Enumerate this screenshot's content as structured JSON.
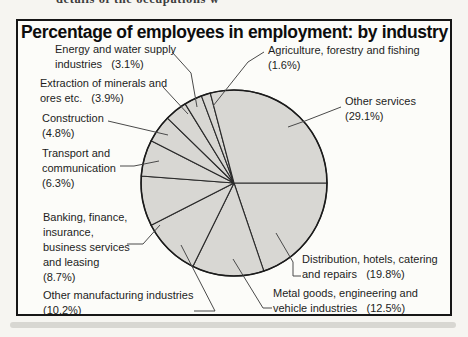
{
  "page": {
    "cropped_top_text": "details of the occupations w",
    "background_color": "#f6f5f1",
    "frame_border_color": "#161616"
  },
  "chart_data": {
    "type": "pie",
    "title": "Percentage of employees in employment: by industry",
    "unit": "%",
    "total": 100,
    "start_angle_deg": 0,
    "direction": "clockwise",
    "legend_position": "none (leader-line labels around pie)",
    "pie": {
      "cx": 234,
      "cy": 183,
      "r": 93,
      "fill": "#d8d7d3",
      "stroke": "#1b1b1b",
      "line_color": "#2a2a2a",
      "leader_color": "#4a4a4a"
    },
    "slices": [
      {
        "name": "Distribution, hotels, catering and repairs",
        "value": 19.8,
        "label_lines": [
          "Distribution, hotels, catering",
          "and repairs   (19.8%)"
        ],
        "label_x": 302,
        "label_y": 252,
        "leader": [
          [
            301,
            276
          ],
          [
            293,
            276
          ],
          [
            293,
            262
          ],
          [
            276,
            233
          ]
        ]
      },
      {
        "name": "Metal goods, engineering and vehicle industries",
        "value": 12.5,
        "label_lines": [
          "Metal goods, engineering and",
          "vehicle industries   (12.5%)"
        ],
        "label_x": 273,
        "label_y": 286,
        "leader": [
          [
            272,
            308
          ],
          [
            263,
            308
          ],
          [
            233,
            259
          ]
        ]
      },
      {
        "name": "Other manufacturing industries",
        "value": 10.2,
        "label_lines": [
          "Other manufacturing industries",
          "(10.2%)"
        ],
        "label_x": 43,
        "label_y": 288,
        "leader": [
          [
            194,
            311
          ],
          [
            215,
            311
          ],
          [
            181,
            245
          ]
        ]
      },
      {
        "name": "Banking, finance, insurance, business services and leasing",
        "value": 8.7,
        "label_lines": [
          "Banking, finance,",
          "insurance,",
          "business services",
          "and leasing",
          "(8.7%)"
        ],
        "label_x": 43,
        "label_y": 210,
        "leader": [
          [
            127,
            244
          ],
          [
            143,
            244
          ],
          [
            160,
            225
          ]
        ]
      },
      {
        "name": "Transport and communication",
        "value": 6.3,
        "label_lines": [
          "Transport and",
          "communication",
          "(6.3%)"
        ],
        "label_x": 42,
        "label_y": 146,
        "leader": [
          [
            120,
            166
          ],
          [
            134,
            166
          ],
          [
            159,
            161
          ]
        ]
      },
      {
        "name": "Construction",
        "value": 4.8,
        "label_lines": [
          "Construction",
          "(4.8%)"
        ],
        "label_x": 42,
        "label_y": 111,
        "leader": [
          [
            108,
            121
          ],
          [
            168,
            135
          ]
        ]
      },
      {
        "name": "Extraction of minerals and ores etc.",
        "value": 3.9,
        "label_lines": [
          "Extraction of minerals and",
          "ores etc.   (3.9%)"
        ],
        "label_x": 40,
        "label_y": 76,
        "leader": [
          [
            163,
            87
          ],
          [
            188,
            114
          ]
        ]
      },
      {
        "name": "Energy and water supply industries",
        "value": 3.1,
        "label_lines": [
          "Energy and water supply",
          "industries   (3.1%)"
        ],
        "label_x": 55,
        "label_y": 42,
        "leader": [
          [
            172,
            52
          ],
          [
            191,
            73
          ],
          [
            197,
            107
          ]
        ]
      },
      {
        "name": "Agriculture, forestry and fishing",
        "value": 1.6,
        "label_lines": [
          "Agriculture, forestry and fishing",
          "(1.6%)"
        ],
        "label_x": 268,
        "label_y": 43,
        "leader": [
          [
            264,
            52
          ],
          [
            248,
            62
          ],
          [
            213,
            106
          ]
        ]
      },
      {
        "name": "Other services",
        "value": 29.1,
        "label_lines": [
          "Other services",
          "(29.1%)"
        ],
        "label_x": 345,
        "label_y": 94,
        "leader": [
          [
            341,
            107
          ],
          [
            305,
            121
          ],
          [
            288,
            127
          ]
        ]
      }
    ]
  }
}
